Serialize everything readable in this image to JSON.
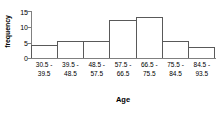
{
  "chart_data": {
    "type": "bar",
    "title": "",
    "subtitle": "",
    "xlabel": "Age",
    "ylabel": "frequency",
    "categories": [
      "30.5 - 39.5",
      "39.5 - 48.5",
      "48.5 - 57.5",
      "57.5 - 66.5",
      "66.5 - 75.5",
      "75.5 - 84.5",
      "84.5 - 93.5"
    ],
    "category_lines": [
      {
        "line1": "30.5 -",
        "line2": "39.5"
      },
      {
        "line1": "39.5 -",
        "line2": "48.5"
      },
      {
        "line1": "48.5 -",
        "line2": "57.5"
      },
      {
        "line1": "57.5 -",
        "line2": "66.5"
      },
      {
        "line1": "66.5 -",
        "line2": "75.5"
      },
      {
        "line1": "75.5 -",
        "line2": "84.5"
      },
      {
        "line1": "84.5 -",
        "line2": "93.5"
      }
    ],
    "values": [
      4,
      5.5,
      5.5,
      12,
      13,
      5.5,
      3.5
    ],
    "ylim": [
      0,
      15
    ],
    "yticks": [
      15,
      10,
      5,
      0
    ],
    "ytick_labels": [
      "15",
      "10",
      "5",
      "0"
    ],
    "grid": false,
    "legend": false,
    "bar_border_color": "#595959",
    "bar_fill_color": "#ffffff",
    "axis_color": "#808080"
  }
}
